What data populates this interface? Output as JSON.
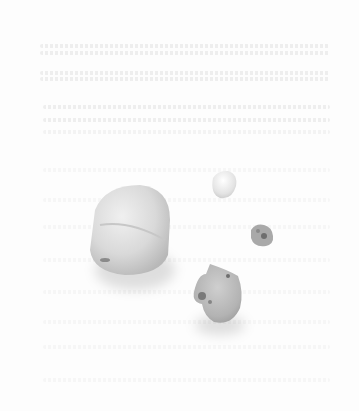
{
  "image": {
    "description": "Grayscale photograph of four stones on a white surface with faint text bleeding through from the reverse side of the page",
    "background_color": "#fdfdfd",
    "stones": [
      {
        "name": "large-oval-stone",
        "shade": "#d9d9d9"
      },
      {
        "name": "small-white-stone",
        "shade": "#e6e6e6"
      },
      {
        "name": "tiny-dark-stone",
        "shade": "#a6a6a6"
      },
      {
        "name": "medium-irregular-stone",
        "shade": "#b4b4b4"
      }
    ]
  }
}
